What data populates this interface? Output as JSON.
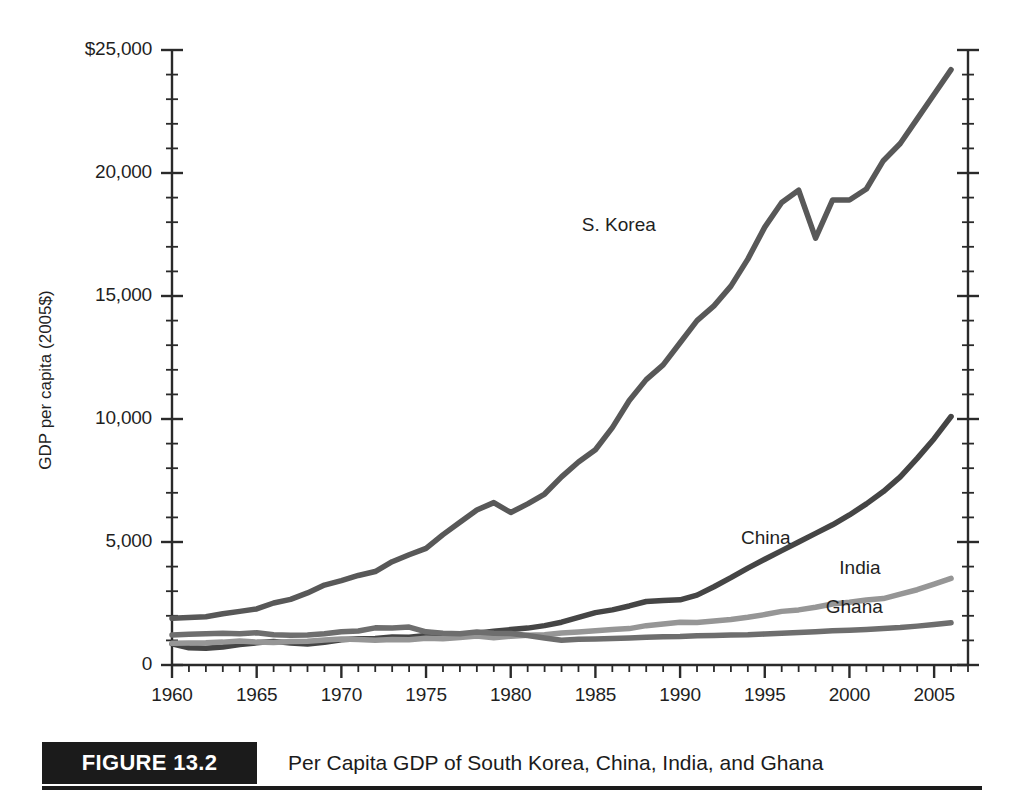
{
  "figure": {
    "badge": "FIGURE 13.2",
    "caption": "Per Capita GDP of South Korea, China, India, and Ghana"
  },
  "axes": {
    "ylabel": "GDP per capita (2005$)",
    "xlabel": "",
    "ytick_labels": [
      "$25,000",
      "20,000",
      "15,000",
      "10,000",
      "5,000",
      "0"
    ],
    "xtick_labels": [
      "1960",
      "1965",
      "1970",
      "1975",
      "1980",
      "1985",
      "1990",
      "1995",
      "2000",
      "2005"
    ]
  },
  "series_labels": {
    "skorea": "S. Korea",
    "china": "China",
    "india": "India",
    "ghana": "Ghana"
  },
  "colors": {
    "skorea": "#585858",
    "china": "#454545",
    "india": "#969696",
    "ghana": "#6e6e6e",
    "axis": "#2a2a2a",
    "badge_bg": "#1b1b1b",
    "background": "#ffffff"
  },
  "chart_data": {
    "type": "line",
    "title": "Per Capita GDP of South Korea, China, India, and Ghana",
    "xlabel": "",
    "ylabel": "GDP per capita (2005$)",
    "xlim": [
      1960,
      2007
    ],
    "ylim": [
      0,
      25000
    ],
    "ytick_values": [
      0,
      5000,
      10000,
      15000,
      20000,
      25000
    ],
    "ytick_labels": [
      "0",
      "5,000",
      "10,000",
      "15,000",
      "20,000",
      "$25,000"
    ],
    "y_minor_tick_interval": 1000,
    "xtick_values": [
      1960,
      1965,
      1970,
      1975,
      1980,
      1985,
      1990,
      1995,
      2000,
      2005
    ],
    "x_minor_tick_interval": 1,
    "grid": false,
    "legend": "direct-labels",
    "x": [
      1960,
      1961,
      1962,
      1963,
      1964,
      1965,
      1966,
      1967,
      1968,
      1969,
      1970,
      1971,
      1972,
      1973,
      1974,
      1975,
      1976,
      1977,
      1978,
      1979,
      1980,
      1981,
      1982,
      1983,
      1984,
      1985,
      1986,
      1987,
      1988,
      1989,
      1990,
      1991,
      1992,
      1993,
      1994,
      1995,
      1996,
      1997,
      1998,
      1999,
      2000,
      2001,
      2002,
      2003,
      2004,
      2005,
      2006
    ],
    "series": [
      {
        "name": "S. Korea",
        "color": "#585858",
        "values": [
          1900,
          1930,
          1960,
          2080,
          2180,
          2280,
          2520,
          2670,
          2930,
          3250,
          3430,
          3640,
          3800,
          4200,
          4480,
          4740,
          5300,
          5800,
          6300,
          6600,
          6200,
          6550,
          6950,
          7650,
          8250,
          8750,
          9650,
          10750,
          11600,
          12200,
          13100,
          14000,
          14600,
          15400,
          16500,
          17800,
          18800,
          19300,
          17350,
          18900,
          18900,
          19350,
          20500,
          21200,
          22200,
          23200,
          24200
        ]
      },
      {
        "name": "China",
        "color": "#454545",
        "values": [
          860,
          700,
          680,
          730,
          830,
          900,
          960,
          890,
          850,
          920,
          1030,
          1070,
          1080,
          1140,
          1130,
          1200,
          1160,
          1200,
          1290,
          1370,
          1440,
          1500,
          1600,
          1740,
          1940,
          2130,
          2240,
          2400,
          2580,
          2620,
          2650,
          2840,
          3180,
          3550,
          3940,
          4300,
          4650,
          5000,
          5350,
          5700,
          6100,
          6550,
          7050,
          7650,
          8400,
          9200,
          10100
        ]
      },
      {
        "name": "India",
        "color": "#969696",
        "values": [
          880,
          890,
          900,
          930,
          980,
          930,
          910,
          960,
          970,
          1020,
          1060,
          1040,
          1010,
          1040,
          1030,
          1090,
          1070,
          1120,
          1180,
          1110,
          1170,
          1210,
          1230,
          1300,
          1340,
          1390,
          1440,
          1480,
          1600,
          1670,
          1740,
          1730,
          1790,
          1850,
          1940,
          2050,
          2180,
          2240,
          2350,
          2480,
          2550,
          2640,
          2700,
          2880,
          3060,
          3290,
          3520
        ]
      },
      {
        "name": "Ghana",
        "color": "#6e6e6e",
        "values": [
          1220,
          1250,
          1270,
          1290,
          1270,
          1310,
          1230,
          1210,
          1220,
          1270,
          1350,
          1380,
          1510,
          1500,
          1540,
          1350,
          1290,
          1270,
          1340,
          1290,
          1280,
          1200,
          1100,
          1010,
          1050,
          1060,
          1080,
          1100,
          1130,
          1150,
          1160,
          1190,
          1200,
          1220,
          1230,
          1260,
          1290,
          1320,
          1350,
          1390,
          1410,
          1440,
          1480,
          1520,
          1580,
          1650,
          1720
        ]
      }
    ]
  }
}
